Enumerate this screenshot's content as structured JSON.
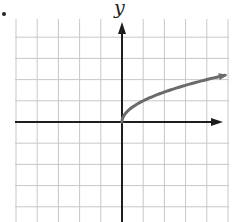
{
  "chart_data": {
    "type": "line",
    "title": "",
    "xlabel": "",
    "ylabel": "y",
    "function": "y = sqrt(x)",
    "x": [
      0,
      0.25,
      0.5,
      1,
      2,
      3,
      4,
      5
    ],
    "series": [
      {
        "name": "sqrt(x)",
        "values": [
          0,
          0.5,
          0.707,
          1,
          1.414,
          1.732,
          2,
          2.236
        ],
        "color": "#6b6b6b"
      }
    ],
    "xlim": [
      -5,
      5
    ],
    "ylim": [
      -5,
      5
    ],
    "grid": true,
    "grid_step": 1,
    "arrows": {
      "x_axis": true,
      "y_axis": true,
      "curve_end": true
    },
    "legend": null
  },
  "colors": {
    "grid": "#c8c8c8",
    "axis": "#1e1e1e",
    "curve": "#6b6b6b"
  },
  "labels": {
    "y_axis": "y"
  }
}
